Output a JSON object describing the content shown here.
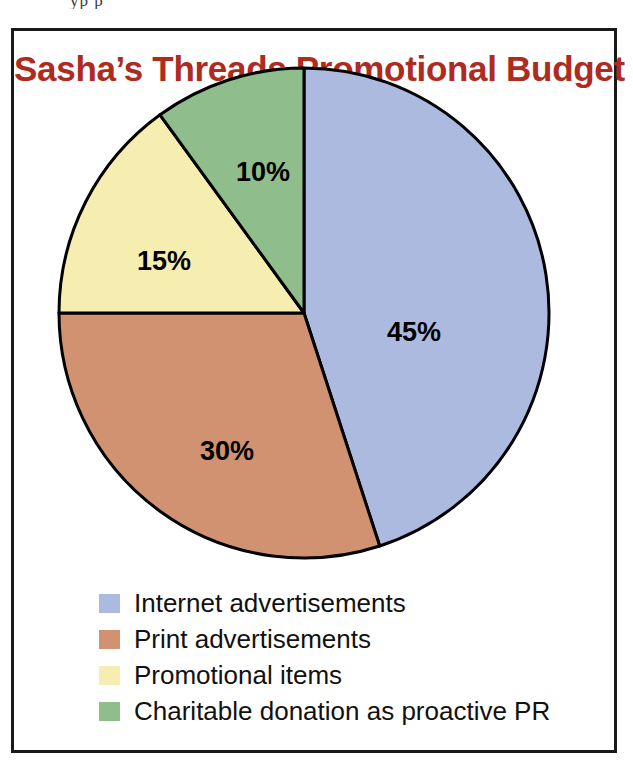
{
  "page": {
    "top_bleed_text": "yp p"
  },
  "chart": {
    "title": "Sasha’s Threads Promotional Budget",
    "title_color": "#ad2b20",
    "border_color": "#191919",
    "background": "#ffffff"
  },
  "chart_data": {
    "type": "pie",
    "title": "Sasha’s Threads Promotional Budget",
    "xlabel": "",
    "ylabel": "",
    "unit": "percent",
    "start_angle_deg": 0,
    "direction": "clockwise",
    "legend_position": "bottom-left",
    "grid": false,
    "categories": [
      "Internet advertisements",
      "Print advertisements",
      "Promotional items",
      "Charitable donation as proactive PR"
    ],
    "values": [
      45,
      30,
      15,
      10
    ],
    "labels": [
      "45%",
      "30%",
      "15%",
      "10%"
    ],
    "colors": [
      "#adbae0",
      "#d09270",
      "#f5eeb0",
      "#8fbd8c"
    ],
    "slice_outline_color": "#000000",
    "slices": [
      {
        "category": "Internet advertisements",
        "value": 45,
        "label": "45%",
        "color": "#adbae0"
      },
      {
        "category": "Print advertisements",
        "value": 30,
        "label": "30%",
        "color": "#d09270"
      },
      {
        "category": "Promotional items",
        "value": 15,
        "label": "15%",
        "color": "#f5eeb0"
      },
      {
        "category": "Charitable donation as proactive PR",
        "value": 10,
        "label": "10%",
        "color": "#8fbd8c"
      }
    ]
  },
  "legend": {
    "items": [
      {
        "label": "Internet advertisements",
        "color": "#adbae0"
      },
      {
        "label": "Print advertisements",
        "color": "#d09270"
      },
      {
        "label": "Promotional items",
        "color": "#f5eeb0"
      },
      {
        "label": "Charitable donation as proactive PR",
        "color": "#8fbd8c"
      }
    ]
  }
}
